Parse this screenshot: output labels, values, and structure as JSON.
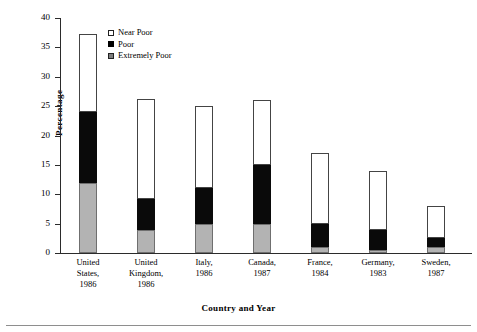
{
  "axes": {
    "y_title": "Percentage",
    "x_title": "Country and Year",
    "y_ticks": [
      "0",
      "5",
      "10",
      "15",
      "20",
      "25",
      "30",
      "35",
      "40"
    ]
  },
  "legend": {
    "items": [
      {
        "label": "Near Poor",
        "swatch": "white-square-icon"
      },
      {
        "label": "Poor",
        "swatch": "black-square-icon"
      },
      {
        "label": "Extremely Poor",
        "swatch": "gray-square-icon"
      }
    ]
  },
  "categories": [
    {
      "line1": "United",
      "line2": "States,",
      "line3": "1986"
    },
    {
      "line1": "United",
      "line2": "Kingdom,",
      "line3": "1986"
    },
    {
      "line1": "Italy,",
      "line2": "1986",
      "line3": ""
    },
    {
      "line1": "Canada,",
      "line2": "1987",
      "line3": ""
    },
    {
      "line1": "France,",
      "line2": "1984",
      "line3": ""
    },
    {
      "line1": "Germany,",
      "line2": "1983",
      "line3": ""
    },
    {
      "line1": "Sweden,",
      "line2": "1987",
      "line3": ""
    }
  ],
  "chart_data": {
    "type": "bar",
    "subtype": "stacked-vertical",
    "title": "",
    "xlabel": "Country and Year",
    "ylabel": "Percentage",
    "ylim": [
      0,
      40
    ],
    "ytick_step": 5,
    "grid": false,
    "legend_position": "inside-top-left",
    "categories": [
      "United States, 1986",
      "United Kingdom, 1986",
      "Italy, 1986",
      "Canada, 1987",
      "France, 1984",
      "Germany, 1983",
      "Sweden, 1987"
    ],
    "series": [
      {
        "name": "Extremely Poor",
        "color": "#b3b3b3",
        "values": [
          12.0,
          4.0,
          5.0,
          5.0,
          1.0,
          0.5,
          1.0
        ]
      },
      {
        "name": "Poor",
        "color": "#000000",
        "values": [
          12.0,
          5.2,
          6.1,
          10.0,
          4.0,
          3.4,
          1.6
        ]
      },
      {
        "name": "Near Poor",
        "color": "#ffffff",
        "values": [
          13.2,
          17.0,
          13.9,
          11.0,
          12.0,
          10.1,
          5.4
        ]
      }
    ],
    "totals": [
      37.2,
      26.2,
      25.0,
      26.0,
      17.0,
      14.0,
      8.0
    ],
    "segment_tops": {
      "extremely_poor": [
        12.0,
        4.0,
        5.0,
        5.0,
        1.0,
        0.5,
        1.0
      ],
      "poor": [
        24.0,
        9.2,
        11.1,
        15.0,
        5.0,
        3.9,
        2.6
      ],
      "near_poor": [
        37.2,
        26.2,
        25.0,
        26.0,
        17.0,
        14.0,
        8.0
      ]
    }
  },
  "render": {
    "plot_left": 60,
    "plot_top": 18,
    "plot_width": 412,
    "plot_height": 235,
    "bar_width": 18,
    "bar_centers": [
      28,
      86,
      144,
      202,
      260,
      318,
      376
    ]
  }
}
